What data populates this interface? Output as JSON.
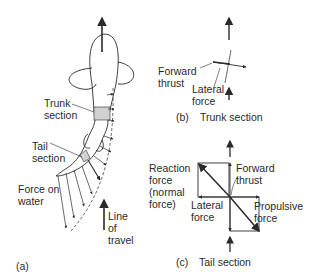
{
  "panel_a": {
    "caption": "(a)",
    "labels": {
      "trunk_section": "Trunk\nsection",
      "tail_section": "Tail\nsection",
      "force_on_water": "Force on\nwater",
      "line_of_travel": "Line\nof\ntravel"
    }
  },
  "panel_b": {
    "caption_letter": "(b)",
    "caption": "Trunk section",
    "labels": {
      "forward_thrust": "Forward\nthrust",
      "lateral_force": "Lateral\nforce"
    }
  },
  "panel_c": {
    "caption_letter": "(c)",
    "caption": "Tail section",
    "labels": {
      "reaction_force": "Reaction\nforce\n(normal\nforce)",
      "forward_thrust": "Forward\nthrust",
      "lateral_force": "Lateral\nforce",
      "propulsive_force": "Propulsive\nforce"
    }
  },
  "colors": {
    "line": "#2a2a2a",
    "shading": "#cfcfcf"
  }
}
